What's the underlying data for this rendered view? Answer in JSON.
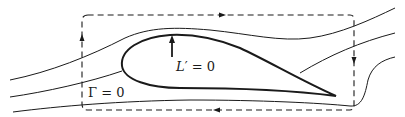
{
  "diagram": {
    "labels": {
      "lift_symbol": "L",
      "lift_prime": "′",
      "lift_value": " = 0",
      "circulation": "Γ = 0"
    },
    "elements": {
      "airfoil": "airfoil-outline",
      "streamlines": 4,
      "control_contour": "dashed rectangular contour with rounded corners",
      "contour_direction": "clockwise",
      "contour_arrows": [
        "top-right-pointing",
        "right-down-pointing",
        "bottom-left-pointing",
        "left-up-pointing"
      ],
      "lift_arrow": "upward arrow"
    },
    "colors": {
      "stroke": "#1a1a1a",
      "background": "#ffffff"
    }
  }
}
